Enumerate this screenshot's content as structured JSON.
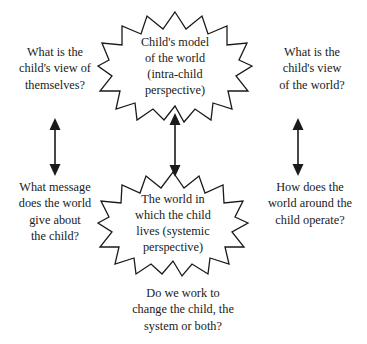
{
  "diagram": {
    "title_visible": false,
    "background_color": "#ffffff",
    "ink_color": "#1a1a1a",
    "nodes": [
      {
        "id": "child-model",
        "shape": "starburst",
        "lines": [
          "Child's model",
          "of the world",
          "(intra-child",
          "perspective)"
        ]
      },
      {
        "id": "world-systemic",
        "shape": "starburst",
        "lines": [
          "The world in",
          "which the child",
          "lives (systemic",
          "perspective)"
        ]
      }
    ],
    "captions": [
      {
        "id": "top-left",
        "lines": [
          "What is the",
          "child's view of",
          "themselves?"
        ]
      },
      {
        "id": "top-right",
        "lines": [
          "What is the",
          "child's view",
          "of the world?"
        ]
      },
      {
        "id": "bottom-left",
        "lines": [
          "What message",
          "does the world",
          "give about",
          "the child?"
        ]
      },
      {
        "id": "bottom-right",
        "lines": [
          "How does the",
          "world around the",
          "child operate?"
        ]
      },
      {
        "id": "bottom-center",
        "lines": [
          "Do we work to",
          "change the child, the",
          "system or both?"
        ]
      }
    ],
    "arrows": [
      {
        "id": "left-arrow",
        "type": "double-headed-vertical"
      },
      {
        "id": "center-arrow",
        "type": "double-headed-vertical"
      },
      {
        "id": "right-arrow",
        "type": "double-headed-vertical"
      }
    ]
  }
}
